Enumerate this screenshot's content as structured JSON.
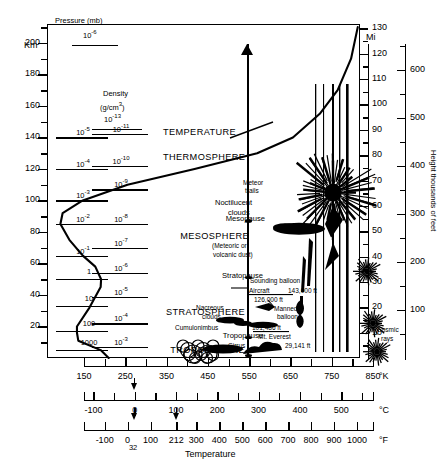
{
  "figure": {
    "xlabel": "Temperature",
    "left_axis_unit": "Km",
    "right_axis_unit": "Mi",
    "far_right_axis_label": "Height thousands of feet"
  },
  "columns": {
    "pressure_header": "Pressure (mb)",
    "pressure_header_value": "10",
    "pressure_header_exp": "-6",
    "density_header_1": "Density",
    "density_header_2": "(g/cm",
    "density_header_2_exp": "3",
    "density_header_2_end": ")",
    "density_header_value": "10",
    "density_header_exp": "-13"
  },
  "pressure_values": [
    {
      "mantissa": "10",
      "exp": "-5",
      "km": 140
    },
    {
      "mantissa": "10",
      "exp": "-4",
      "km": 120
    },
    {
      "mantissa": "10",
      "exp": "-3",
      "km": 100
    },
    {
      "mantissa": "10",
      "exp": "-2",
      "km": 85
    },
    {
      "mantissa": "10",
      "exp": "-1",
      "km": 65
    },
    {
      "mantissa": "1",
      "exp": "",
      "km": 50
    },
    {
      "mantissa": "10",
      "exp": "",
      "km": 33
    },
    {
      "mantissa": "100",
      "exp": "",
      "km": 17
    },
    {
      "mantissa": "1000",
      "exp": "",
      "km": 5
    }
  ],
  "density_values": [
    {
      "mantissa": "10",
      "exp": "-11",
      "km": 142
    },
    {
      "mantissa": "10",
      "exp": "-10",
      "km": 122
    },
    {
      "mantissa": "10",
      "exp": "-9",
      "km": 107
    },
    {
      "mantissa": "10",
      "exp": "-8",
      "km": 85
    },
    {
      "mantissa": "10",
      "exp": "-7",
      "km": 70
    },
    {
      "mantissa": "10",
      "exp": "-6",
      "km": 54
    },
    {
      "mantissa": "10",
      "exp": "-5",
      "km": 39
    },
    {
      "mantissa": "10",
      "exp": "-4",
      "km": 22
    },
    {
      "mantissa": "10",
      "exp": "-3",
      "km": 7
    }
  ],
  "km_axis": {
    "label": "Km",
    "ticks": [
      200,
      180,
      160,
      140,
      120,
      100,
      80,
      60,
      40,
      20
    ],
    "minor_between": true
  },
  "mi_axis": {
    "label": "Mi",
    "ticks": [
      130,
      120,
      110,
      100,
      90,
      80,
      70,
      60,
      50,
      40,
      30,
      20,
      10
    ]
  },
  "feet_axis": {
    "label": "Height thousands of feet",
    "ticks": [
      700,
      600,
      500,
      400,
      300,
      200,
      100
    ]
  },
  "curve_label": "TEMPERATURE",
  "layers": [
    {
      "name": "THERMOSPHERE",
      "type": "layer"
    },
    {
      "name": "Mesopause",
      "type": "pause"
    },
    {
      "name": "MESOSPHERE",
      "type": "layer"
    },
    {
      "name": "Stratopause",
      "type": "pause"
    },
    {
      "name": "STRATOSPHERE",
      "type": "layer"
    },
    {
      "name": "Tropopause",
      "type": "pause"
    },
    {
      "name": "TROPOSPHERE",
      "type": "layer"
    }
  ],
  "annotations": {
    "aurora": "Aurora",
    "meteor_trails_1": "Meteor",
    "meteor_trails_2": "trails",
    "noctilucent_1": "Noctilucent",
    "noctilucent_2": "clouds",
    "dust_1": "(Meteoric or",
    "dust_2": "volcanic dust)",
    "sounding_balloon": "Sounding balloon",
    "sounding_balloon_alt": "143,000 ft",
    "aircraft": "Aircraft",
    "aircraft_alt": "126,000 ft",
    "manned_balloon_1": "Manned",
    "manned_balloon_2": "balloon",
    "manned_balloon_alt": "101,486 ft",
    "everest": "Mt. Everest",
    "everest_alt": "29,141 ft",
    "nacreous_1": "Nacreous",
    "nacreous_2": "clouds",
    "cumulonimbus": "Cumulonimbus",
    "cirrus": "Cirrus",
    "cosmic_1": "Cosmic",
    "cosmic_2": "rays"
  },
  "temp_axes": {
    "kelvin": {
      "unit": "°K",
      "ticks": [
        150,
        250,
        350,
        450,
        550,
        650,
        750,
        850
      ],
      "min": 150,
      "max": 850
    },
    "celsius": {
      "unit": "°C",
      "ticks": [
        -100,
        0,
        100,
        200,
        300,
        400,
        500
      ],
      "min": -123,
      "max": 577
    },
    "fahrenheit": {
      "unit": "°F",
      "ticks": [
        -100,
        0,
        100,
        212,
        300,
        400,
        500,
        600,
        700,
        800,
        900,
        1000
      ],
      "marker_32": "32",
      "min": -190,
      "max": 1070
    },
    "xlabel": "Temperature"
  },
  "chart_data": {
    "type": "line",
    "xlabel": "Temperature",
    "ylabel": "Km",
    "xlim": [
      150,
      850
    ],
    "ylim": [
      0,
      210
    ],
    "series": [
      {
        "name": "Temperature profile",
        "x": [
          288,
          270,
          220,
          217,
          217,
          245,
          270,
          271,
          258,
          230,
          200,
          180,
          185,
          230,
          330,
          480,
          620,
          700,
          760,
          800,
          830,
          845
        ],
        "y": [
          0,
          5,
          11,
          16,
          20,
          32,
          45,
          50,
          58,
          65,
          75,
          85,
          92,
          100,
          110,
          120,
          130,
          140,
          155,
          170,
          190,
          210
        ]
      }
    ],
    "grid": false,
    "legend": "none"
  }
}
